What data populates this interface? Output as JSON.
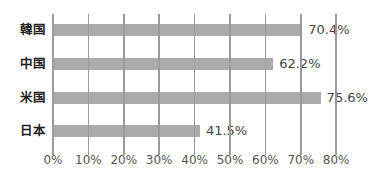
{
  "chart_data": {
    "type": "bar",
    "orientation": "horizontal",
    "title": "",
    "xlabel": "",
    "ylabel": "",
    "categories": [
      "韓国",
      "中国",
      "米国",
      "日本"
    ],
    "values": [
      70.4,
      62.2,
      75.6,
      41.5
    ],
    "value_labels": [
      "70.4%",
      "62.2%",
      "75.6%",
      "41.5%"
    ],
    "xlim": [
      0,
      80
    ],
    "x_ticks": [
      "0%",
      "10%",
      "20%",
      "30%",
      "40%",
      "50%",
      "60%",
      "70%",
      "80%"
    ],
    "grid": true,
    "legend": null,
    "colors": {
      "bar": "#ababab",
      "grid": "#9a9a9a",
      "text": "#444444"
    }
  }
}
